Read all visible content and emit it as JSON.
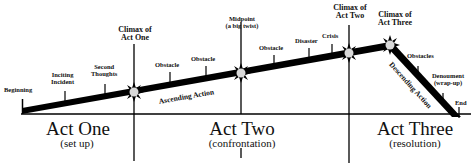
{
  "diagram": {
    "type": "three-act-structure",
    "colors": {
      "line": "#000000",
      "background": "#ffffff",
      "burst": "#d8d8d8"
    },
    "plot_points": [
      {
        "id": "beginning",
        "label": "Beginning"
      },
      {
        "id": "inciting-incident",
        "label_1": "Inciting",
        "label_2": "Incident"
      },
      {
        "id": "second-thoughts",
        "label_1": "Second",
        "label_2": "Thoughts"
      },
      {
        "id": "climax-act-one",
        "label_1": "Climax of",
        "label_2": "Act One"
      },
      {
        "id": "obstacle-1",
        "label": "Obstacle"
      },
      {
        "id": "obstacle-2",
        "label": "Obstacle"
      },
      {
        "id": "midpoint",
        "label_1": "Midpoint",
        "label_2": "(a big twist)"
      },
      {
        "id": "obstacle-3",
        "label": "Obstacle"
      },
      {
        "id": "disaster",
        "label": "Disaster"
      },
      {
        "id": "crisis",
        "label": "Crisis"
      },
      {
        "id": "climax-act-two",
        "label_1": "Climax of",
        "label_2": "Act Two"
      },
      {
        "id": "climax-act-three",
        "label_1": "Climax of",
        "label_2": "Act Three"
      },
      {
        "id": "obstacles",
        "label": "Obstacles"
      },
      {
        "id": "denouement",
        "label_1": "Denoument",
        "label_2": "(wrap-up)"
      },
      {
        "id": "end",
        "label": "End"
      }
    ],
    "actions": {
      "ascending": "Ascending Action",
      "descending": "Descending Action"
    },
    "acts": [
      {
        "title": "Act One",
        "subtitle": "(set up)"
      },
      {
        "title": "Act Two",
        "subtitle": "(confrontation)"
      },
      {
        "title": "Act Three",
        "subtitle": "(resolution)"
      }
    ]
  }
}
